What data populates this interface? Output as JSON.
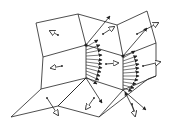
{
  "diagram": {
    "type": "mesh-vector-field",
    "stroke_color": "#222222",
    "background": "#ffffff",
    "mesh_edges": [
      [
        36,
        23,
        78,
        14
      ],
      [
        78,
        14,
        86,
        45
      ],
      [
        86,
        45,
        43,
        57
      ],
      [
        43,
        57,
        36,
        23
      ],
      [
        43,
        57,
        41,
        89
      ],
      [
        86,
        45,
        86,
        78
      ],
      [
        41,
        89,
        86,
        78
      ],
      [
        78,
        14,
        117,
        25
      ],
      [
        86,
        45,
        123,
        56
      ],
      [
        117,
        25,
        123,
        56
      ],
      [
        117,
        25,
        147,
        11
      ],
      [
        147,
        11,
        156,
        43
      ],
      [
        123,
        56,
        156,
        43
      ],
      [
        123,
        56,
        123,
        90
      ],
      [
        156,
        43,
        156,
        76
      ],
      [
        123,
        90,
        156,
        76
      ],
      [
        86,
        78,
        123,
        90
      ],
      [
        41,
        89,
        11,
        117
      ],
      [
        11,
        117,
        58,
        106
      ],
      [
        58,
        106,
        86,
        78
      ],
      [
        58,
        106,
        99,
        117
      ],
      [
        99,
        117,
        123,
        90
      ],
      [
        99,
        117,
        148,
        79
      ],
      [
        148,
        79,
        156,
        76
      ],
      [
        86,
        78,
        58,
        106
      ]
    ],
    "hollow_arrows": [
      {
        "x1": 58,
        "y1": 35,
        "x2": 50,
        "y2": 31
      },
      {
        "x1": 62,
        "y1": 66,
        "x2": 51,
        "y2": 68
      },
      {
        "x1": 106,
        "y1": 64,
        "x2": 118,
        "y2": 63
      },
      {
        "x1": 103,
        "y1": 34,
        "x2": 114,
        "y2": 27
      },
      {
        "x1": 143,
        "y1": 66,
        "x2": 160,
        "y2": 62
      },
      {
        "x1": 137,
        "y1": 34,
        "x2": 158,
        "y2": 23
      },
      {
        "x1": 47,
        "y1": 98,
        "x2": 58,
        "y2": 115
      },
      {
        "x1": 94,
        "y1": 98,
        "x2": 86,
        "y2": 109
      },
      {
        "x1": 132,
        "y1": 104,
        "x2": 135,
        "y2": 116
      }
    ],
    "fan_origins": [
      {
        "x": 86,
        "y": 45,
        "label": "vertex-a"
      },
      {
        "x": 123,
        "y": 56,
        "label": "vertex-b"
      }
    ],
    "fan_a": [
      [
        86,
        47,
        98,
        40
      ],
      [
        86,
        50,
        100,
        45
      ],
      [
        86,
        53,
        101,
        50
      ],
      [
        86,
        56,
        102,
        55
      ],
      [
        86,
        59,
        102,
        60
      ],
      [
        86,
        62,
        102,
        64
      ],
      [
        86,
        65,
        102,
        68
      ],
      [
        86,
        68,
        101,
        72
      ],
      [
        86,
        71,
        100,
        76
      ],
      [
        86,
        74,
        99,
        80
      ],
      [
        86,
        77,
        97,
        84
      ]
    ],
    "fan_b": [
      [
        123,
        58,
        135,
        51
      ],
      [
        123,
        61,
        137,
        56
      ],
      [
        123,
        64,
        138,
        60
      ],
      [
        123,
        67,
        139,
        64
      ],
      [
        123,
        70,
        139,
        68
      ],
      [
        123,
        73,
        139,
        72
      ],
      [
        123,
        76,
        139,
        76
      ],
      [
        123,
        79,
        138,
        80
      ],
      [
        123,
        82,
        136,
        84
      ],
      [
        123,
        85,
        134,
        88
      ],
      [
        123,
        88,
        132,
        91
      ]
    ],
    "long_arrows": [
      {
        "x1": 86,
        "y1": 45,
        "x2": 110,
        "y2": 16
      },
      {
        "x1": 123,
        "y1": 56,
        "x2": 147,
        "y2": 28
      },
      {
        "x1": 86,
        "y1": 78,
        "x2": 102,
        "y2": 103
      },
      {
        "x1": 123,
        "y1": 90,
        "x2": 146,
        "y2": 110
      },
      {
        "x1": 135,
        "y1": 112,
        "x2": 125,
        "y2": 92
      }
    ]
  }
}
